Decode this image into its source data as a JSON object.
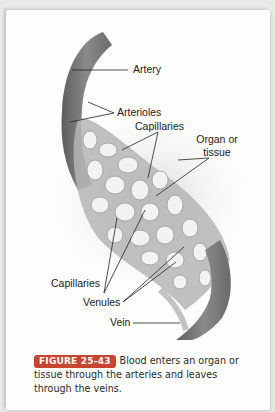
{
  "figure": {
    "labels": {
      "artery": "Artery",
      "arterioles": "Arterioles",
      "capillaries_top": "Capillaries",
      "organ_line1": "Organ or",
      "organ_line2": "tissue",
      "capillaries_bottom": "Capillaries",
      "venules": "Venules",
      "vein": "Vein"
    }
  },
  "caption": {
    "badge": "FIGURE 25-43",
    "text": "Blood enters an organ or tissue through the arteries and leaves through the veins."
  },
  "colors": {
    "badge": "#c8452f",
    "vessel": "#7d7d7d",
    "background": "#fdfdfc"
  }
}
